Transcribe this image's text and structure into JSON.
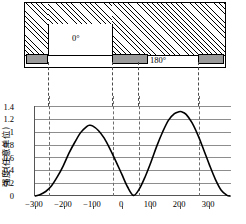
{
  "figure": {
    "mask": {
      "title": "phase-shift-mask-cross-section",
      "regions": [
        {
          "name": "phase-0-aperture",
          "label": "0°",
          "label_x": 52,
          "label_y": 34
        },
        {
          "name": "phase-180-aperture",
          "label": "180°",
          "label_x": 128,
          "label_y": 54
        }
      ],
      "opaque_blocks": [
        {
          "name": "chrome-block-left",
          "x": 2,
          "w": 22
        },
        {
          "name": "chrome-block-mid",
          "x": 88,
          "w": 36
        },
        {
          "name": "chrome-block-right",
          "x": 174,
          "w": 26
        }
      ],
      "shifter_notch": {
        "x": 24,
        "w": 64,
        "top": 22
      }
    }
  },
  "chart_data": {
    "type": "line",
    "title": "",
    "xlabel": "",
    "ylabel": "强度(任意单位)",
    "xlim": [
      -340,
      330
    ],
    "ylim": [
      0,
      1.4
    ],
    "grid": true,
    "legend": null,
    "yticks": [
      0,
      0.2,
      0.4,
      0.6,
      0.8,
      1,
      1.2,
      1.4
    ],
    "ytick_labels": [
      "0",
      "0.2",
      "0.4",
      "0.6",
      "0.8",
      "1",
      "1.2",
      "1.4"
    ],
    "xticks": [
      -300,
      -200,
      -100,
      0,
      100,
      200,
      300
    ],
    "xtick_labels": [
      "−300",
      "−200",
      "−100",
      "0",
      "100",
      "200",
      "300"
    ],
    "vertical_dashed_lines": [
      -250,
      -45,
      40,
      245
    ],
    "series": [
      {
        "name": "intensity",
        "color": "#000000",
        "peaks": [
          {
            "x": -150,
            "y": 1.1
          },
          {
            "x": 160,
            "y": 1.31
          }
        ],
        "minima": [
          {
            "x": -330,
            "y": 0.0
          },
          {
            "x": 0,
            "y": 0.0
          },
          {
            "x": 325,
            "y": 0.0
          }
        ],
        "x": [
          -335,
          -320,
          -300,
          -280,
          -260,
          -240,
          -220,
          -200,
          -180,
          -160,
          -150,
          -140,
          -120,
          -100,
          -80,
          -60,
          -40,
          -20,
          0,
          20,
          40,
          60,
          80,
          100,
          120,
          140,
          155,
          165,
          180,
          200,
          220,
          240,
          260,
          280,
          300,
          320,
          330
        ],
        "y": [
          0.0,
          0.02,
          0.07,
          0.16,
          0.3,
          0.47,
          0.67,
          0.84,
          0.99,
          1.08,
          1.1,
          1.09,
          1.02,
          0.9,
          0.73,
          0.54,
          0.34,
          0.14,
          0.01,
          0.11,
          0.3,
          0.53,
          0.78,
          1.0,
          1.18,
          1.28,
          1.31,
          1.31,
          1.27,
          1.14,
          0.95,
          0.72,
          0.48,
          0.26,
          0.09,
          0.01,
          0.0
        ]
      }
    ]
  }
}
